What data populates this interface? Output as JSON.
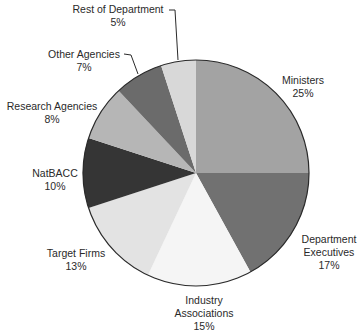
{
  "chart_data": {
    "type": "pie",
    "title": "",
    "start_angle": "12 o'clock",
    "direction": "clockwise",
    "slices": [
      {
        "label": "Ministers",
        "value": 25,
        "display": "25%",
        "color": "#a3a3a3"
      },
      {
        "label": "Department Executives",
        "value": 17,
        "display": "17%",
        "color": "#717171"
      },
      {
        "label": "Industry Associations",
        "value": 15,
        "display": "15%",
        "color": "#f5f5f5"
      },
      {
        "label": "Target Firms",
        "value": 13,
        "display": "13%",
        "color": "#e3e3e3"
      },
      {
        "label": "NatBACC",
        "value": 10,
        "display": "10%",
        "color": "#353535"
      },
      {
        "label": "Research Agencies",
        "value": 8,
        "display": "8%",
        "color": "#b6b6b6"
      },
      {
        "label": "Other Agencies",
        "value": 7,
        "display": "7%",
        "color": "#6b6b6b"
      },
      {
        "label": "Rest of Department",
        "value": 5,
        "display": "5%",
        "color": "#d8d8d8"
      }
    ],
    "labels": {
      "ministers": {
        "line1": "Ministers",
        "pct": "25%"
      },
      "dept_exec": {
        "line1": "Department",
        "line2": "Executives",
        "pct": "17%"
      },
      "industry": {
        "line1": "Industry",
        "line2": "Associations",
        "pct": "15%"
      },
      "target": {
        "line1": "Target Firms",
        "pct": "13%"
      },
      "natbacc": {
        "line1": "NatBACC",
        "pct": "10%"
      },
      "research": {
        "line1": "Research Agencies",
        "pct": "8%"
      },
      "other": {
        "line1": "Other Agencies",
        "pct": "7%"
      },
      "rest": {
        "line1": "Rest of Department",
        "pct": "5%"
      }
    },
    "legend": "none (direct labels with leader lines for small slices)"
  }
}
